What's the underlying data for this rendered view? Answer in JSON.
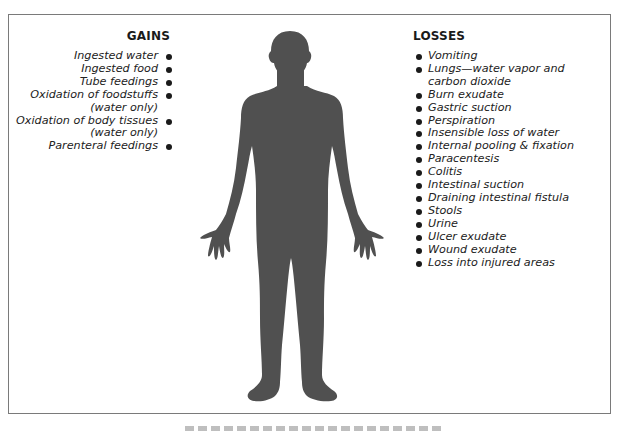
{
  "figure": {
    "gains": {
      "heading": "GAINS",
      "items": [
        {
          "line1": "Ingested water",
          "line2": ""
        },
        {
          "line1": "Ingested food",
          "line2": ""
        },
        {
          "line1": "Tube feedings",
          "line2": ""
        },
        {
          "line1": "Oxidation of foodstuffs",
          "line2": "(water only)"
        },
        {
          "line1": "Oxidation of body tissues",
          "line2": "(water only)"
        },
        {
          "line1": "Parenteral feedings",
          "line2": ""
        }
      ]
    },
    "losses": {
      "heading": "LOSSES",
      "items": [
        {
          "line1": "Vomiting",
          "line2": ""
        },
        {
          "line1": "Lungs—water vapor and",
          "line2": "carbon dioxide"
        },
        {
          "line1": "Burn exudate",
          "line2": ""
        },
        {
          "line1": "Gastric suction",
          "line2": ""
        },
        {
          "line1": "Perspiration",
          "line2": ""
        },
        {
          "line1": "Insensible loss of water",
          "line2": ""
        },
        {
          "line1": "Internal pooling & fixation",
          "line2": ""
        },
        {
          "line1": "Paracentesis",
          "line2": ""
        },
        {
          "line1": "Colitis",
          "line2": ""
        },
        {
          "line1": "Intestinal suction",
          "line2": ""
        },
        {
          "line1": "Draining intestinal fistula",
          "line2": ""
        },
        {
          "line1": "Stools",
          "line2": ""
        },
        {
          "line1": "Urine",
          "line2": ""
        },
        {
          "line1": "Ulcer exudate",
          "line2": ""
        },
        {
          "line1": "Wound exudate",
          "line2": ""
        },
        {
          "line1": "Loss into injured areas",
          "line2": ""
        }
      ]
    },
    "colors": {
      "silhouette": "#505050",
      "frame": "#7a7a7a",
      "text": "#1e1e1e"
    }
  }
}
